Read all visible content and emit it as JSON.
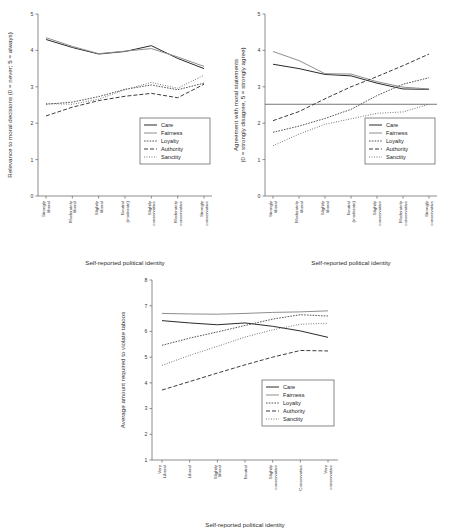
{
  "figure": {
    "panels": [
      "panel-relevance",
      "panel-agreement",
      "panel-taboos"
    ]
  },
  "shared": {
    "legend_labels": [
      "Care",
      "Fairness",
      "Loyalty",
      "Authority",
      "Sanctity"
    ],
    "xlabel": "Self-reported political identity",
    "colors": {
      "care": "#2b2b2b",
      "fairness": "#8e8e8e",
      "loyalty": "#555555",
      "authority": "#3d3d3d",
      "sanctity": "#6a6a6a",
      "axis": "#6e6e6e",
      "text": "#2b2b2b",
      "background": "#ffffff"
    },
    "dash": {
      "care": "none",
      "fairness": "none",
      "loyalty": "1.6 1.2",
      "authority": "4 2",
      "sanctity": "0.9 1.6"
    }
  },
  "chart_data": [
    {
      "id": "panel-relevance",
      "type": "line",
      "title": "",
      "ylabel": "Relevance to moral decisions (0 = never; 5 = always)",
      "xlabel": "Self-reported political identity",
      "ylim": [
        0,
        5
      ],
      "yticks": [
        0,
        1,
        2,
        3,
        4,
        5
      ],
      "grid": false,
      "legend_position": "bottom-right",
      "categories": [
        "Strongly liberal",
        "Moderately liberal",
        "Slightly liberal",
        "Neutral (moderate)",
        "Slightly conservative",
        "Moderately conservative",
        "Strongly conservative"
      ],
      "series": [
        {
          "name": "Care",
          "values": [
            4.3,
            4.08,
            3.9,
            3.97,
            4.13,
            3.78,
            3.5
          ]
        },
        {
          "name": "Fairness",
          "values": [
            4.35,
            4.11,
            3.91,
            3.98,
            4.05,
            3.82,
            3.56
          ]
        },
        {
          "name": "Loyalty",
          "values": [
            2.52,
            2.58,
            2.73,
            2.93,
            3.05,
            2.92,
            3.1
          ]
        },
        {
          "name": "Authority",
          "values": [
            2.2,
            2.44,
            2.62,
            2.74,
            2.82,
            2.7,
            3.07
          ]
        },
        {
          "name": "Sanctity",
          "values": [
            2.54,
            2.52,
            2.66,
            2.92,
            3.12,
            2.96,
            3.32
          ]
        }
      ]
    },
    {
      "id": "panel-agreement",
      "type": "line",
      "title": "",
      "ylabel": "Agreement with moral statements (0 = strongly disagree, 5 = strongly agree)",
      "xlabel": "Self-reported political identity",
      "ylim": [
        0,
        5
      ],
      "yticks": [
        0,
        1,
        2,
        3,
        4,
        5
      ],
      "grid": false,
      "legend_position": "bottom-right",
      "reference_line": 2.52,
      "categories": [
        "Strongly liberal",
        "Moderately liberal",
        "Slightly liberal",
        "Neutral (moderate)",
        "Slightly conservative",
        "Moderately conservative",
        "Strongly conservative"
      ],
      "series": [
        {
          "name": "Care",
          "values": [
            3.62,
            3.5,
            3.34,
            3.3,
            3.1,
            2.94,
            2.93
          ]
        },
        {
          "name": "Fairness",
          "values": [
            3.97,
            3.72,
            3.36,
            3.35,
            3.14,
            2.99,
            2.94
          ]
        },
        {
          "name": "Loyalty",
          "values": [
            1.75,
            1.92,
            2.13,
            2.38,
            2.76,
            3.07,
            3.25
          ]
        },
        {
          "name": "Authority",
          "values": [
            2.07,
            2.32,
            2.67,
            3.0,
            3.28,
            3.58,
            3.9
          ]
        },
        {
          "name": "Sanctity",
          "values": [
            1.38,
            1.7,
            1.97,
            2.12,
            2.27,
            2.31,
            2.52
          ]
        }
      ]
    },
    {
      "id": "panel-taboos",
      "type": "line",
      "title": "",
      "ylabel": "Average amount required to violate taboos",
      "xlabel": "Self-reported political identity",
      "ylim": [
        1,
        8
      ],
      "yticks": [
        1,
        2,
        3,
        4,
        5,
        6,
        7,
        8
      ],
      "grid": false,
      "legend_position": "bottom-right",
      "categories": [
        "Very Liberal",
        "Liberal",
        "Slightly liberal",
        "Neutral",
        "Slightly conservative",
        "Conservative",
        "Very conservative"
      ],
      "series": [
        {
          "name": "Care",
          "values": [
            6.42,
            6.33,
            6.26,
            6.33,
            6.2,
            6.02,
            5.77
          ]
        },
        {
          "name": "Fairness",
          "values": [
            6.7,
            6.68,
            6.67,
            6.7,
            6.74,
            6.76,
            6.8
          ]
        },
        {
          "name": "Loyalty",
          "values": [
            5.46,
            5.74,
            5.98,
            6.23,
            6.48,
            6.65,
            6.6
          ]
        },
        {
          "name": "Authority",
          "values": [
            3.72,
            4.05,
            4.38,
            4.7,
            5.0,
            5.26,
            5.24
          ]
        },
        {
          "name": "Sanctity",
          "values": [
            4.68,
            5.07,
            5.42,
            5.78,
            6.06,
            6.28,
            6.32
          ]
        }
      ]
    }
  ]
}
